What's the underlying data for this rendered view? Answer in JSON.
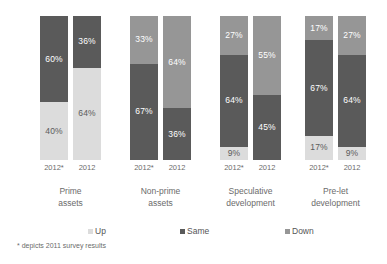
{
  "chart_data": {
    "type": "bar",
    "subtype": "100-percent-stacked-column",
    "title": "",
    "subtitle": "",
    "xlabel": "",
    "ylabel": "",
    "ylim": [
      0,
      100
    ],
    "grid": false,
    "legend_position": "bottom",
    "orientation": "vertical",
    "stack_order_bottom_to_top": [
      "Up",
      "Same",
      "Down"
    ],
    "categories": [
      "Prime assets",
      "Non-prime assets",
      "Speculative development",
      "Pre-let development"
    ],
    "subgroups": [
      "2012*",
      "2012"
    ],
    "series": [
      {
        "name": "Up",
        "color": "#dcdcdc",
        "values": [
          [
            40,
            64
          ],
          [
            0,
            0
          ],
          [
            9,
            0
          ],
          [
            17,
            9
          ]
        ]
      },
      {
        "name": "Same",
        "color": "#5a5a5a",
        "values": [
          [
            60,
            36
          ],
          [
            67,
            36
          ],
          [
            64,
            45
          ],
          [
            67,
            64
          ]
        ]
      },
      {
        "name": "Down",
        "color": "#969696",
        "values": [
          [
            0,
            0
          ],
          [
            33,
            64
          ],
          [
            27,
            55
          ],
          [
            17,
            27
          ]
        ]
      }
    ],
    "groups": [
      {
        "category_line1": "Prime",
        "category_line2": "assets",
        "bars": [
          {
            "tick": "2012*",
            "segments": [
              {
                "series": "Down",
                "value": 0,
                "label": ""
              },
              {
                "series": "Same",
                "value": 60,
                "label": "60%"
              },
              {
                "series": "Up",
                "value": 40,
                "label": "40%"
              }
            ]
          },
          {
            "tick": "2012",
            "segments": [
              {
                "series": "Down",
                "value": 0,
                "label": ""
              },
              {
                "series": "Same",
                "value": 36,
                "label": "36%"
              },
              {
                "series": "Up",
                "value": 64,
                "label": "64%"
              }
            ]
          }
        ]
      },
      {
        "category_line1": "Non-prime",
        "category_line2": "assets",
        "bars": [
          {
            "tick": "2012*",
            "segments": [
              {
                "series": "Down",
                "value": 33,
                "label": "33%"
              },
              {
                "series": "Same",
                "value": 67,
                "label": "67%"
              },
              {
                "series": "Up",
                "value": 0,
                "label": ""
              }
            ]
          },
          {
            "tick": "2012",
            "segments": [
              {
                "series": "Down",
                "value": 64,
                "label": "64%"
              },
              {
                "series": "Same",
                "value": 36,
                "label": "36%"
              },
              {
                "series": "Up",
                "value": 0,
                "label": ""
              }
            ]
          }
        ]
      },
      {
        "category_line1": "Speculative",
        "category_line2": "development",
        "bars": [
          {
            "tick": "2012*",
            "segments": [
              {
                "series": "Down",
                "value": 27,
                "label": "27%"
              },
              {
                "series": "Same",
                "value": 64,
                "label": "64%"
              },
              {
                "series": "Up",
                "value": 9,
                "label": "9%"
              }
            ]
          },
          {
            "tick": "2012",
            "segments": [
              {
                "series": "Down",
                "value": 55,
                "label": "55%"
              },
              {
                "series": "Same",
                "value": 45,
                "label": "45%"
              },
              {
                "series": "Up",
                "value": 0,
                "label": ""
              }
            ]
          }
        ]
      },
      {
        "category_line1": "Pre-let",
        "category_line2": "development",
        "bars": [
          {
            "tick": "2012*",
            "segments": [
              {
                "series": "Down",
                "value": 17,
                "label": "17%"
              },
              {
                "series": "Same",
                "value": 67,
                "label": "67%"
              },
              {
                "series": "Up",
                "value": 17,
                "label": "17%"
              }
            ]
          },
          {
            "tick": "2012",
            "segments": [
              {
                "series": "Down",
                "value": 27,
                "label": "27%"
              },
              {
                "series": "Same",
                "value": 64,
                "label": "64%"
              },
              {
                "series": "Up",
                "value": 9,
                "label": "9%"
              }
            ]
          }
        ]
      }
    ],
    "legend": [
      {
        "label": "Up",
        "color": "#dcdcdc"
      },
      {
        "label": "Same",
        "color": "#5a5a5a"
      },
      {
        "label": "Down",
        "color": "#969696"
      }
    ],
    "footnote": "* depicts 2011 survey results"
  },
  "colors": {
    "up": "#dcdcdc",
    "same": "#5a5a5a",
    "down": "#969696",
    "background": "#ffffff",
    "text": "#6b6b6b"
  }
}
